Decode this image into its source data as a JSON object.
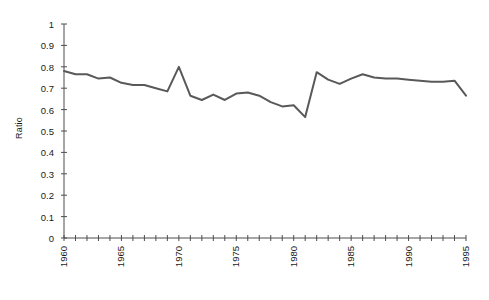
{
  "chart_data": {
    "type": "line",
    "title": "",
    "subtitle": "",
    "xlabel": "",
    "ylabel": "Ratio",
    "xlim": [
      1960,
      1995
    ],
    "ylim": [
      0,
      1
    ],
    "grid": false,
    "legend": null,
    "legend_position": "none",
    "line_color": "#595959",
    "line_width": 2,
    "x_tick_labels": [
      "1960",
      "1965",
      "1970",
      "1975",
      "1980",
      "1985",
      "1990",
      "1995"
    ],
    "x_tick_values": [
      1960,
      1965,
      1970,
      1975,
      1980,
      1985,
      1990,
      1995
    ],
    "x_minor_tick_values": [
      1960,
      1961,
      1962,
      1963,
      1964,
      1965,
      1966,
      1967,
      1968,
      1969,
      1970,
      1971,
      1972,
      1973,
      1974,
      1975,
      1976,
      1977,
      1978,
      1979,
      1980,
      1981,
      1982,
      1983,
      1984,
      1985,
      1986,
      1987,
      1988,
      1989,
      1990,
      1991,
      1992,
      1993,
      1994,
      1995
    ],
    "y_tick_labels": [
      "0",
      "0.1",
      "0.2",
      "0.3",
      "0.4",
      "0.5",
      "0.6",
      "0.7",
      "0.8",
      "0.9",
      "1"
    ],
    "y_tick_values": [
      0,
      0.1,
      0.2,
      0.3,
      0.4,
      0.5,
      0.6,
      0.7,
      0.8,
      0.9,
      1
    ],
    "x": [
      1960,
      1961,
      1962,
      1963,
      1964,
      1965,
      1966,
      1967,
      1968,
      1969,
      1970,
      1971,
      1972,
      1973,
      1974,
      1975,
      1976,
      1977,
      1978,
      1979,
      1980,
      1981,
      1982,
      1983,
      1984,
      1985,
      1986,
      1987,
      1988,
      1989,
      1990,
      1991,
      1992,
      1993,
      1994,
      1995
    ],
    "values": [
      0.78,
      0.765,
      0.765,
      0.745,
      0.75,
      0.725,
      0.715,
      0.715,
      0.7,
      0.685,
      0.8,
      0.665,
      0.645,
      0.67,
      0.645,
      0.675,
      0.68,
      0.665,
      0.635,
      0.615,
      0.62,
      0.565,
      0.775,
      0.74,
      0.72,
      0.745,
      0.765,
      0.75,
      0.745,
      0.745,
      0.74,
      0.735,
      0.73,
      0.73,
      0.735,
      0.665
    ],
    "series": [
      {
        "name": "Ratio",
        "values": [
          0.78,
          0.765,
          0.765,
          0.745,
          0.75,
          0.725,
          0.715,
          0.715,
          0.7,
          0.685,
          0.8,
          0.665,
          0.645,
          0.67,
          0.645,
          0.675,
          0.68,
          0.665,
          0.635,
          0.615,
          0.62,
          0.565,
          0.775,
          0.74,
          0.72,
          0.745,
          0.765,
          0.75,
          0.745,
          0.745,
          0.74,
          0.735,
          0.73,
          0.73,
          0.735,
          0.665
        ]
      }
    ]
  },
  "axis": {
    "axis_color": "#4d4d4d",
    "y_label": "Ratio"
  }
}
